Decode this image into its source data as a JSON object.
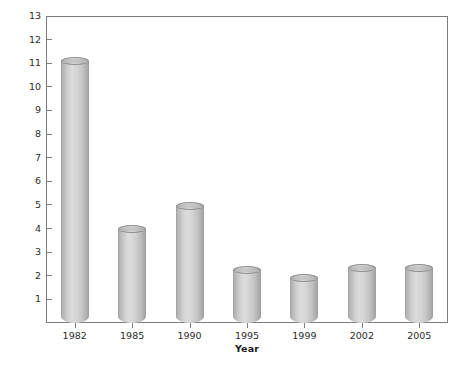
{
  "chart_data": {
    "type": "bar",
    "title": "",
    "subtitle": "",
    "xlabel": "Year",
    "ylabel": "Percent Increase in Consumer Price Index",
    "categories": [
      "1982",
      "1985",
      "1990",
      "1995",
      "1999",
      "2002",
      "2005"
    ],
    "values": [
      11.1,
      4.0,
      4.95,
      2.25,
      1.9,
      2.35,
      2.35
    ],
    "series": [
      {
        "name": "Percent Increase in Consumer Price Index",
        "values": [
          11.1,
          4.0,
          4.95,
          2.25,
          1.9,
          2.35,
          2.35
        ]
      }
    ],
    "ylim": [
      0,
      13
    ],
    "ytick_values": [
      1,
      2,
      3,
      4,
      5,
      6,
      7,
      8,
      9,
      10,
      11,
      12,
      13
    ],
    "ytick_labels": [
      "1",
      "2",
      "3",
      "4",
      "5",
      "6",
      "7",
      "8",
      "9",
      "10",
      "11",
      "12",
      "13"
    ],
    "grid": false,
    "legend": false,
    "legend_position": "none",
    "bar_style": "3d-cylinder",
    "bar_color": "#d2d2d2",
    "axis_color": "#7d7d7d",
    "text_color": "#2b2b2b",
    "background": "#ffffff"
  }
}
